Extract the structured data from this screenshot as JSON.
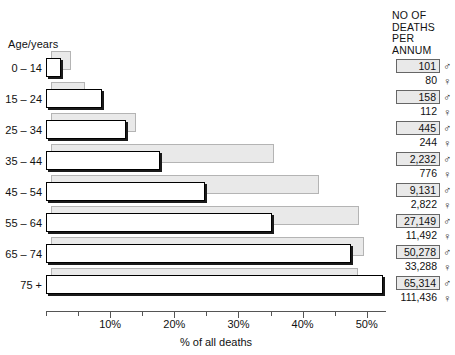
{
  "chart": {
    "axis_title": "Age/years",
    "xlabel": "% of all deaths",
    "right_header": {
      "line1": "NO OF",
      "line2": "DEATHS",
      "line3": "PER",
      "line4": "ANNUM"
    },
    "male_symbol": "♂",
    "female_symbol": "♀"
  },
  "chart_data": {
    "type": "bar",
    "orientation": "horizontal",
    "title": "",
    "xlabel": "% of all deaths",
    "ylabel": "Age/years",
    "xlim": [
      0,
      53
    ],
    "grid": false,
    "legend": "none",
    "categories": [
      "0 – 14",
      "15 – 24",
      "25 – 34",
      "35 – 44",
      "45 – 54",
      "55 – 64",
      "65 – 74",
      "75 +"
    ],
    "xticks": [
      0,
      5,
      10,
      15,
      20,
      25,
      30,
      35,
      40,
      45,
      50
    ],
    "xticklabels": [
      "",
      "",
      "10%",
      "",
      "20%",
      "",
      "30%",
      "",
      "40%",
      "",
      "50%"
    ],
    "series": [
      {
        "name": "Male",
        "symbol": "♂",
        "values": [
          2.3,
          8.8,
          12.5,
          17.8,
          24.8,
          35.3,
          47.5,
          52.6
        ],
        "deaths": [
          "101",
          "158",
          "445",
          "2,232",
          "9,131",
          "27,149",
          "50,278",
          "65,314"
        ]
      },
      {
        "name": "Female",
        "symbol": "♀",
        "values": [
          3.1,
          5.3,
          13.3,
          34.7,
          41.7,
          48.0,
          48.8,
          47.8
        ],
        "deaths": [
          "80",
          "112",
          "244",
          "776",
          "2,822",
          "11,492",
          "33,288",
          "111,436"
        ]
      }
    ]
  },
  "rows": [
    {
      "age": "0 – 14",
      "male_deaths": "101",
      "female_deaths": "80"
    },
    {
      "age": "15 – 24",
      "male_deaths": "158",
      "female_deaths": "112"
    },
    {
      "age": "25 – 34",
      "male_deaths": "445",
      "female_deaths": "244"
    },
    {
      "age": "35 – 44",
      "male_deaths": "2,232",
      "female_deaths": "776"
    },
    {
      "age": "45 – 54",
      "male_deaths": "9,131",
      "female_deaths": "2,822"
    },
    {
      "age": "55 – 64",
      "male_deaths": "27,149",
      "female_deaths": "11,492"
    },
    {
      "age": "65 – 74",
      "male_deaths": "50,278",
      "female_deaths": "33,288"
    },
    {
      "age": "75 +",
      "male_deaths": "65,314",
      "female_deaths": "111,436"
    }
  ]
}
